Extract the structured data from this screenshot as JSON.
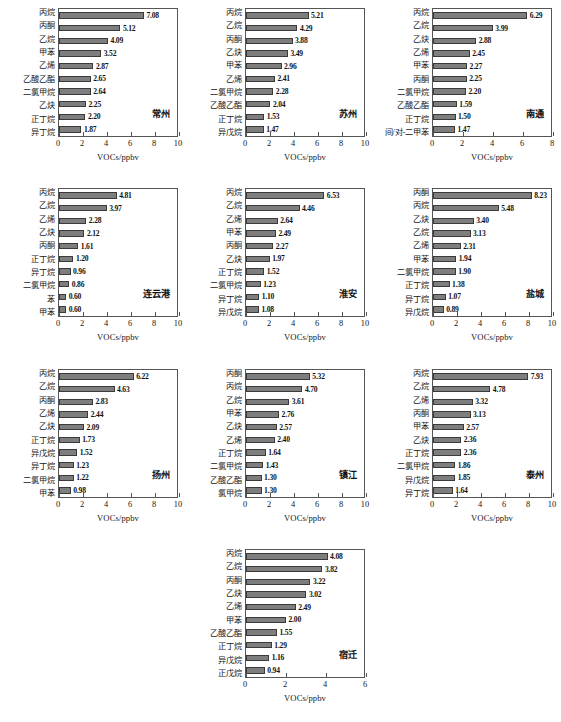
{
  "figure": {
    "axis_title": "VOCs/ppbv",
    "bar_color": "#7e7e7e",
    "bar_edge_color": "#3a3a3a",
    "frame_color": "#555555"
  },
  "chart_data": [
    {
      "type": "bar",
      "title": "常州",
      "xlabel": "VOCs/ppbv",
      "ylabel": "",
      "xlim": [
        0,
        10
      ],
      "xticks": [
        0,
        2,
        4,
        6,
        8,
        10
      ],
      "grid": false,
      "orientation": "horizontal",
      "categories": [
        "丙烷",
        "丙酮",
        "乙烷",
        "甲苯",
        "乙烯",
        "乙酸乙酯",
        "二氯甲烷",
        "乙炔",
        "正丁烷",
        "异丁烷"
      ],
      "values": [
        7.08,
        5.12,
        4.09,
        3.52,
        2.87,
        2.65,
        2.64,
        2.25,
        2.2,
        1.87
      ]
    },
    {
      "type": "bar",
      "title": "苏州",
      "xlabel": "VOCs/ppbv",
      "ylabel": "",
      "xlim": [
        0,
        10
      ],
      "xticks": [
        0,
        2,
        4,
        6,
        8,
        10
      ],
      "grid": false,
      "orientation": "horizontal",
      "categories": [
        "丙烷",
        "乙烷",
        "丙酮",
        "乙炔",
        "甲苯",
        "乙烯",
        "二氯甲烷",
        "乙酸乙酯",
        "正丁烷",
        "异戊烷"
      ],
      "values": [
        5.21,
        4.29,
        3.88,
        3.49,
        2.96,
        2.41,
        2.28,
        2.04,
        1.53,
        1.47
      ]
    },
    {
      "type": "bar",
      "title": "南通",
      "xlabel": "VOCs/ppbv",
      "ylabel": "",
      "xlim": [
        0,
        8
      ],
      "xticks": [
        0,
        2,
        4,
        6,
        8
      ],
      "grid": false,
      "orientation": "horizontal",
      "categories": [
        "丙烷",
        "乙烷",
        "乙炔",
        "乙烯",
        "甲苯",
        "丙酮",
        "二氯甲烷",
        "乙酸乙酯",
        "正丁烷",
        "间/对-二甲苯"
      ],
      "values": [
        6.29,
        3.99,
        2.88,
        2.45,
        2.27,
        2.25,
        2.2,
        1.59,
        1.5,
        1.47
      ]
    },
    {
      "type": "bar",
      "title": "连云港",
      "xlabel": "VOCs/ppbv",
      "ylabel": "",
      "xlim": [
        0,
        10
      ],
      "xticks": [
        0,
        2,
        4,
        6,
        8,
        10
      ],
      "grid": false,
      "orientation": "horizontal",
      "categories": [
        "丙烷",
        "乙烷",
        "乙烯",
        "乙炔",
        "丙酮",
        "正丁烷",
        "异丁烷",
        "二氯甲烷",
        "苯",
        "甲苯"
      ],
      "values": [
        4.81,
        3.97,
        2.28,
        2.12,
        1.61,
        1.2,
        0.96,
        0.86,
        0.6,
        0.6
      ]
    },
    {
      "type": "bar",
      "title": "淮安",
      "xlabel": "VOCs/ppbv",
      "ylabel": "",
      "xlim": [
        0,
        10
      ],
      "xticks": [
        0,
        2,
        4,
        6,
        8,
        10
      ],
      "grid": false,
      "orientation": "horizontal",
      "categories": [
        "丙烷",
        "乙烷",
        "乙烯",
        "甲苯",
        "丙酮",
        "乙炔",
        "正丁烷",
        "二氯甲烷",
        "异丁烷",
        "异戊烷"
      ],
      "values": [
        6.53,
        4.46,
        2.64,
        2.49,
        2.27,
        1.97,
        1.52,
        1.23,
        1.1,
        1.08
      ]
    },
    {
      "type": "bar",
      "title": "盐城",
      "xlabel": "VOCs/ppbv",
      "ylabel": "",
      "xlim": [
        0,
        10
      ],
      "xticks": [
        0,
        2,
        4,
        6,
        8,
        10
      ],
      "grid": false,
      "orientation": "horizontal",
      "categories": [
        "丙酮",
        "丙烷",
        "乙炔",
        "乙烷",
        "乙烯",
        "甲苯",
        "二氯甲烷",
        "正丁烷",
        "异丁烷",
        "异戊烷"
      ],
      "values": [
        8.23,
        5.48,
        3.4,
        3.13,
        2.31,
        1.94,
        1.9,
        1.38,
        1.07,
        0.89
      ]
    },
    {
      "type": "bar",
      "title": "扬州",
      "xlabel": "VOCs/ppbv",
      "ylabel": "",
      "xlim": [
        0,
        10
      ],
      "xticks": [
        0,
        2,
        4,
        6,
        8,
        10
      ],
      "grid": false,
      "orientation": "horizontal",
      "categories": [
        "丙烷",
        "乙烷",
        "丙酮",
        "乙烯",
        "乙炔",
        "正丁烷",
        "异戊烷",
        "异丁烷",
        "二氯甲烷",
        "甲苯"
      ],
      "values": [
        6.22,
        4.63,
        2.83,
        2.44,
        2.09,
        1.73,
        1.52,
        1.23,
        1.22,
        0.98
      ]
    },
    {
      "type": "bar",
      "title": "镇江",
      "xlabel": "VOCs/ppbv",
      "ylabel": "",
      "xlim": [
        0,
        10
      ],
      "xticks": [
        0,
        2,
        4,
        6,
        8,
        10
      ],
      "grid": false,
      "orientation": "horizontal",
      "categories": [
        "丙酮",
        "丙烷",
        "乙烷",
        "甲苯",
        "乙炔",
        "乙烯",
        "正丁烷",
        "二氯甲烷",
        "乙酸乙酯",
        "氯甲烷"
      ],
      "values": [
        5.32,
        4.7,
        3.61,
        2.76,
        2.57,
        2.4,
        1.64,
        1.43,
        1.3,
        1.3
      ]
    },
    {
      "type": "bar",
      "title": "泰州",
      "xlabel": "VOCs/ppbv",
      "ylabel": "",
      "xlim": [
        0,
        10
      ],
      "xticks": [
        0,
        2,
        4,
        6,
        8,
        10
      ],
      "grid": false,
      "orientation": "horizontal",
      "categories": [
        "丙烷",
        "乙烷",
        "乙烯",
        "丙酮",
        "甲苯",
        "乙炔",
        "正丁烷",
        "二氯甲烷",
        "异戊烷",
        "异丁烷"
      ],
      "values": [
        7.93,
        4.78,
        3.32,
        3.13,
        2.57,
        2.36,
        2.36,
        1.86,
        1.85,
        1.64
      ]
    },
    {
      "type": "bar",
      "title": "宿迁",
      "xlabel": "VOCs/ppbv",
      "ylabel": "",
      "xlim": [
        0,
        6
      ],
      "xticks": [
        0,
        2,
        4,
        6
      ],
      "grid": false,
      "orientation": "horizontal",
      "categories": [
        "丙烷",
        "乙烷",
        "丙酮",
        "乙炔",
        "乙烯",
        "甲苯",
        "乙酸乙酯",
        "正丁烷",
        "异戊烷",
        "正戊烷"
      ],
      "values": [
        4.08,
        3.82,
        3.22,
        3.02,
        2.49,
        2.0,
        1.55,
        1.29,
        1.16,
        0.94
      ]
    }
  ]
}
